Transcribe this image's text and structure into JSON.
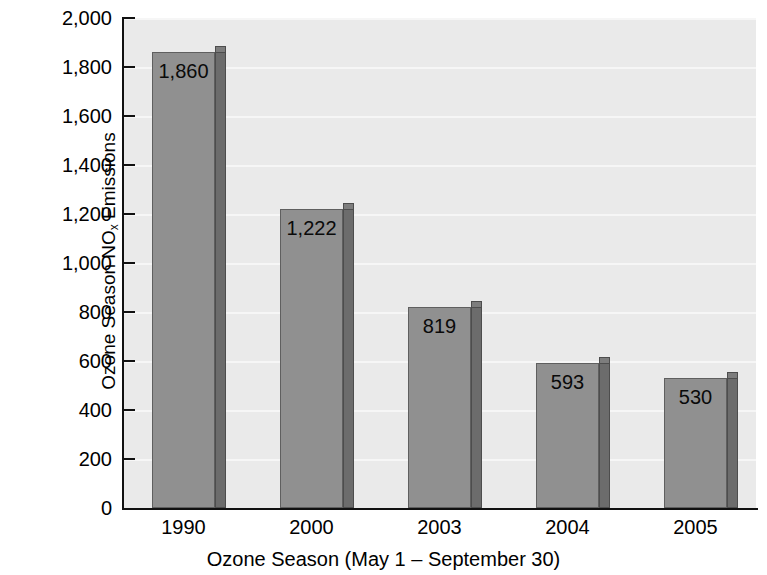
{
  "chart_data": {
    "type": "bar",
    "title": "",
    "categories": [
      "1990",
      "2000",
      "2003",
      "2004",
      "2005"
    ],
    "values": [
      1860,
      1222,
      819,
      593,
      530
    ],
    "value_labels": [
      "1,860",
      "1,222",
      "819",
      "593",
      "530"
    ],
    "xlabel": "Ozone Season (May 1 – September 30)",
    "ylabel_line1_pre": "Ozone Season NO",
    "ylabel_line1_sub": "x",
    "ylabel_line1_post": " Emissions",
    "ylabel_line2": "(Thousand Tons)",
    "ylim": [
      0,
      2000
    ],
    "ytick_values": [
      0,
      200,
      400,
      600,
      800,
      1000,
      1200,
      1400,
      1600,
      1800,
      2000
    ],
    "ytick_labels": [
      "0",
      "200",
      "400",
      "600",
      "800",
      "1,000",
      "1,200",
      "1,400",
      "1,600",
      "1,800",
      "2,000"
    ],
    "grid": true,
    "legend": "none",
    "colors": {
      "bar_front": "#909090",
      "bar_side": "#6c6c6c",
      "plot_background": "#eaeaea",
      "gridline": "#f6f6f6",
      "axis": "#111111",
      "text": "#000000"
    }
  },
  "top_cropped_text": "• • • •"
}
